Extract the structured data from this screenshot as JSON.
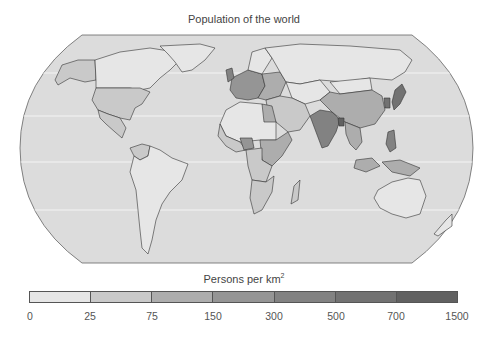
{
  "title": "Population of the world",
  "legend": {
    "title": "Persons per km",
    "title_superscript": "2",
    "ticks": [
      "0",
      "25",
      "75",
      "150",
      "300",
      "500",
      "700",
      "1500"
    ],
    "bins": [
      {
        "range": "0–25",
        "color": "#e6e6e6"
      },
      {
        "range": "25–75",
        "color": "#c9c9c9"
      },
      {
        "range": "75–150",
        "color": "#adadad"
      },
      {
        "range": "150–300",
        "color": "#959595"
      },
      {
        "range": "300–500",
        "color": "#828282"
      },
      {
        "range": "500–700",
        "color": "#727272"
      },
      {
        "range": "700–1500",
        "color": "#616161"
      }
    ]
  },
  "map": {
    "ocean_color": "#dcdcdc",
    "graticule_color": "#f4f4f4",
    "regions": {
      "canada": 0,
      "greenland": 0,
      "usa": 1,
      "alaska": 1,
      "mexico": 1,
      "south_america": 0,
      "colombia": 1,
      "russia": 0,
      "europe_west": 3,
      "europe_east": 2,
      "uk": 4,
      "north_africa": 0,
      "west_africa": 1,
      "nigeria": 3,
      "east_africa": 2,
      "southern_africa": 1,
      "egypt": 2,
      "middle_east": 1,
      "central_asia": 0,
      "china": 2,
      "mongolia": 0,
      "india": 4,
      "bangladesh": 6,
      "southeast_asia": 2,
      "japan": 5,
      "korea": 5,
      "indonesia": 2,
      "philippines": 4,
      "australia": 0,
      "new_zealand": 0
    }
  }
}
